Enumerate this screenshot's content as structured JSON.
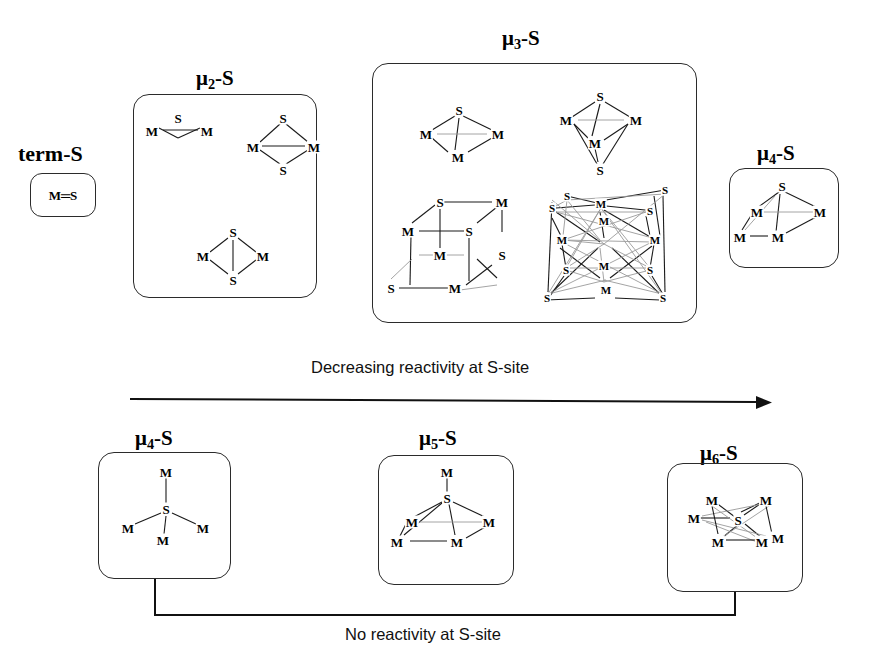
{
  "figure": {
    "title_absent": true,
    "groups": [
      {
        "id": "term-s",
        "label_prefix": "term",
        "label_suffix": "-S",
        "label_type": "plain",
        "structures": [
          "M=S"
        ]
      },
      {
        "id": "mu2-s",
        "label_prefix": "μ",
        "label_sub": "2",
        "label_suffix": "-S",
        "label_type": "mu",
        "structures": [
          "M-S-M triangle with M–M bond",
          "M2S2 diamond with M–M bond",
          "M2S2 diamond with S–S bond"
        ]
      },
      {
        "id": "mu3-s",
        "label_prefix": "μ",
        "label_sub": "3",
        "label_suffix": "-S",
        "label_type": "mu",
        "structures": [
          "M3S tetrahedron",
          "M3S2 trigonal bipyramid",
          "M4S4 cubane",
          "large M–S polyhedral cluster"
        ]
      },
      {
        "id": "mu4-s-top",
        "label_prefix": "μ",
        "label_sub": "4",
        "label_suffix": "-S",
        "label_type": "mu",
        "structures": [
          "M4S square pyramid"
        ]
      },
      {
        "id": "mu4-s-bottom",
        "label_prefix": "μ",
        "label_sub": "4",
        "label_suffix": "-S",
        "label_type": "mu",
        "structures": [
          "SM4 tetrahedral, central S"
        ]
      },
      {
        "id": "mu5-s",
        "label_prefix": "μ",
        "label_sub": "5",
        "label_suffix": "-S",
        "label_type": "mu",
        "structures": [
          "SM5 square pyramidal, central S"
        ]
      },
      {
        "id": "mu6-s",
        "label_prefix": "μ",
        "label_sub": "6",
        "label_suffix": "-S",
        "label_type": "mu",
        "structures": [
          "SM6 octahedral, central S"
        ]
      }
    ],
    "atom_labels": {
      "metal": "M",
      "sulfur": "S",
      "terminal_unit": "M═S"
    },
    "annotations": {
      "top_arrow": "Decreasing reactivity at S-site",
      "bottom_bracket": "No reactivity at S-site"
    },
    "colors": {
      "ink": "#1a1a1a",
      "box_stroke": "#2b2b2b",
      "faint_bond": "#9a9a9a",
      "background": "#ffffff"
    }
  }
}
